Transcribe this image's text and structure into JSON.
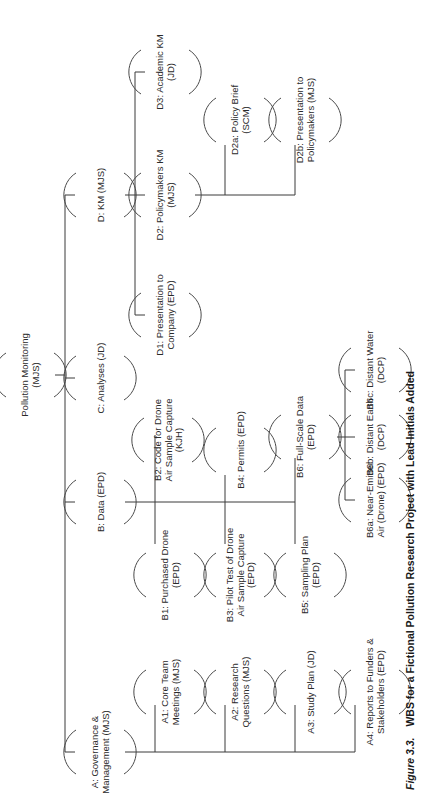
{
  "caption": {
    "label": "Figure 3.3.",
    "title": "WBS for a Fictional Pollution Research Project with Lead Initials Added"
  },
  "wbs": {
    "root": {
      "lines": [
        "Pollution Monitoring",
        "(MJS)"
      ]
    },
    "A": {
      "lines": [
        "A: Governance &",
        "Management (MJS)"
      ]
    },
    "A1": {
      "lines": [
        "A1: Core Team",
        "Meetings (MJS)"
      ]
    },
    "A2": {
      "lines": [
        "A2: Research",
        "Questions (MJS)"
      ]
    },
    "A3": {
      "lines": [
        "A3: Study Plan (JD)"
      ]
    },
    "A4": {
      "lines": [
        "A4: Reports to Funders &",
        "Stakeholders (EPD)"
      ]
    },
    "B": {
      "lines": [
        "B: Data (EPD)"
      ]
    },
    "B1": {
      "lines": [
        "B1: Purchased Drone",
        "(EPD)"
      ]
    },
    "B2": {
      "lines": [
        "B2: Code for Drone",
        "Air Sample Capture",
        "(KJH)"
      ]
    },
    "B3": {
      "lines": [
        "B3: Pilot Test of Drone",
        "Air Sample Capture",
        "(EPD)"
      ]
    },
    "B4": {
      "lines": [
        "B4: Permits (EPD)"
      ]
    },
    "B5": {
      "lines": [
        "B5: Sampling  Plan",
        "(EPD)"
      ]
    },
    "B6": {
      "lines": [
        "B6: Full-Scale Data",
        "(EPD)"
      ]
    },
    "B6a": {
      "lines": [
        "B6a: Near-Emitter",
        "Air  (Drone) (EPD)"
      ]
    },
    "B6b": {
      "lines": [
        "B6b: Distant Earth",
        "(DCP)"
      ]
    },
    "B6c": {
      "lines": [
        "B6c: Distant Water",
        "(DCP)"
      ]
    },
    "C": {
      "lines": [
        "C: Analyses (JD)"
      ]
    },
    "D": {
      "lines": [
        "D: KM (MJS)"
      ]
    },
    "D1": {
      "lines": [
        "D1: Presentation to",
        "Company (EPD)"
      ]
    },
    "D2": {
      "lines": [
        "D2: Policymakers KM",
        "(MJS)"
      ]
    },
    "D2a": {
      "lines": [
        "D2a: Policy Brief",
        "(SCM)"
      ]
    },
    "D2b": {
      "lines": [
        "D2b: Presentation to",
        "Policymakers (MJS)"
      ]
    },
    "D3": {
      "lines": [
        "D3: Academic KM",
        "(JD)"
      ]
    }
  }
}
